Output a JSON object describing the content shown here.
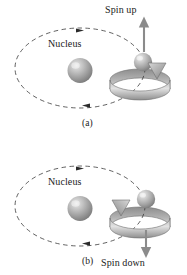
{
  "figure": {
    "background_color": "#ffffff",
    "ink_color": "#222222",
    "sphere_color": "#9a9a9a",
    "ribbon_color": "#8d8d8d"
  },
  "panels": [
    {
      "id": "a",
      "caption": "(a)",
      "nucleus_label": "Nucleus",
      "spin_label": "Spin up",
      "spin_direction": "up",
      "spin_arrow_icon": "arrow-up-icon",
      "orbit_icon": "dashed-ellipse-orbit-icon",
      "orbit_direction": "clockwise",
      "rotation_icon": "spin-ribbon-counterclockwise-icon",
      "nucleus_icon": "nucleus-sphere-icon",
      "electron_icon": "electron-sphere-icon"
    },
    {
      "id": "b",
      "caption": "(b)",
      "nucleus_label": "Nucleus",
      "spin_label": "Spin down",
      "spin_direction": "down",
      "spin_arrow_icon": "arrow-down-icon",
      "orbit_icon": "dashed-ellipse-orbit-icon",
      "orbit_direction": "clockwise",
      "rotation_icon": "spin-ribbon-clockwise-icon",
      "nucleus_icon": "nucleus-sphere-icon",
      "electron_icon": "electron-sphere-icon"
    }
  ]
}
